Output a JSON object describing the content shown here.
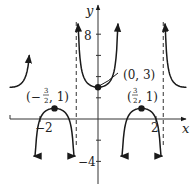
{
  "chart_data": {
    "type": "line",
    "title": "",
    "function": "y = sec(2πx/3) + 2",
    "xlabel": "x",
    "ylabel": "y",
    "xlim": [
      -3.05,
      3.05
    ],
    "ylim": [
      -5.3,
      10.5
    ],
    "x_ticks": [
      {
        "value": -2,
        "label": "−2"
      },
      {
        "value": 2,
        "label": "2"
      }
    ],
    "y_ticks": [
      {
        "value": 8,
        "label": "8"
      },
      {
        "value": 6,
        "label": ""
      },
      {
        "value": 4,
        "label": ""
      },
      {
        "value": 2,
        "label": ""
      },
      {
        "value": -2,
        "label": ""
      },
      {
        "value": -4,
        "label": "−4"
      }
    ],
    "asymptotes": [
      -0.75,
      2.25
    ],
    "branches": [
      {
        "name": "upper-left",
        "x_from": -3.05,
        "x_to": -2.37,
        "direction": "up-right"
      },
      {
        "name": "lower-left",
        "x_from": -2.22,
        "x_to": -0.78,
        "direction": "down-both"
      },
      {
        "name": "upper-center",
        "x_from": -0.69,
        "x_to": 0.69,
        "direction": "up-both"
      },
      {
        "name": "lower-right",
        "x_from": 0.78,
        "x_to": 2.22,
        "direction": "down-both"
      },
      {
        "name": "upper-right",
        "x_from": 2.31,
        "x_to": 3.05,
        "direction": "up-left"
      }
    ],
    "points": [
      {
        "x": -1.5,
        "y": 1,
        "label": "(−3/2, 1)"
      },
      {
        "x": 0,
        "y": 3,
        "label": "(0, 3)"
      },
      {
        "x": 1.5,
        "y": 1,
        "label": "(3/2, 1)"
      }
    ],
    "grid": false
  },
  "labels": {
    "y_axis": "y",
    "x_axis": "x",
    "tick_8": "8",
    "tick_neg4": "−4",
    "tick_neg2x": "−2",
    "tick_2x": "2",
    "pt_center": "(0, 3)",
    "frac_num": "3",
    "frac_den": "2",
    "pt_left_open": "(−",
    "pt_right_open": "(",
    "pt_close": ", 1)"
  },
  "colors": {
    "curve": "#1a1a1a",
    "axis": "#333333"
  }
}
